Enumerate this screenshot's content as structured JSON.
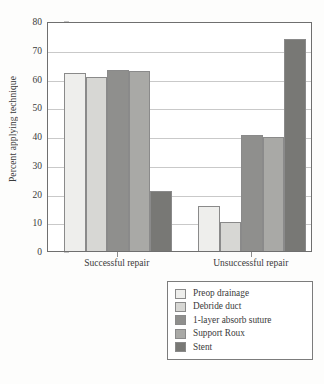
{
  "chart_data": {
    "type": "bar",
    "title": "",
    "subtitle": "",
    "xlabel": "",
    "ylabel": "Percent applying technique",
    "ylim": [
      0,
      80
    ],
    "ytick_step": 10,
    "yticks": [
      "0",
      "10",
      "20",
      "30",
      "40",
      "50",
      "60",
      "70",
      "80"
    ],
    "grid": "horizontal",
    "legend_position": "bottom-right",
    "categories": [
      "Successful repair",
      "Unsuccessful repair"
    ],
    "series": [
      {
        "name": "Preop drainage",
        "color": "#eeeeec",
        "values": [
          61.8,
          15.6
        ]
      },
      {
        "name": "Debride duct",
        "color": "#d7d7d4",
        "values": [
          60.7,
          10.0
        ]
      },
      {
        "name": "1-layer absorb suture",
        "color": "#8f8f8d",
        "values": [
          63.1,
          40.2
        ]
      },
      {
        "name": "Support Roux",
        "color": "#a9a9a6",
        "values": [
          62.5,
          39.8
        ]
      },
      {
        "name": "Stent",
        "color": "#787875",
        "values": [
          20.9,
          73.6
        ]
      }
    ]
  },
  "legend": {
    "items": [
      {
        "label": "Preop drainage",
        "color": "#eeeeec"
      },
      {
        "label": "Debride duct",
        "color": "#d7d7d4"
      },
      {
        "label": "1-layer absorb suture",
        "color": "#8f8f8d"
      },
      {
        "label": "Support Roux",
        "color": "#a9a9a6"
      },
      {
        "label": "Stent",
        "color": "#787875"
      }
    ]
  },
  "axis": {
    "y_title": "Percent applying technique",
    "x_categories": [
      "Successful repair",
      "Unsuccessful repair"
    ]
  }
}
